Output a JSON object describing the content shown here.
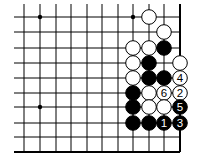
{
  "board": {
    "grid": {
      "xs": [
        24,
        40,
        56,
        71,
        87,
        102,
        118,
        133,
        149,
        164,
        180
      ],
      "ys": [
        17,
        32,
        48,
        63,
        78,
        93,
        107,
        123,
        137,
        152
      ],
      "left_extent": 14,
      "top_extent": 4,
      "right_edge_col": 10,
      "bottom_edge_row": 9
    },
    "line_color": "#000000",
    "stone_radius": 7.3,
    "star_points": [
      [
        1,
        0
      ],
      [
        7,
        0
      ],
      [
        1,
        6
      ]
    ],
    "stones": [
      {
        "col": 8,
        "row": 0,
        "color": "white",
        "label": ""
      },
      {
        "col": 9,
        "row": 1,
        "color": "white",
        "label": ""
      },
      {
        "col": 7,
        "row": 2,
        "color": "white",
        "label": ""
      },
      {
        "col": 8,
        "row": 2,
        "color": "white",
        "label": ""
      },
      {
        "col": 9,
        "row": 2,
        "color": "black",
        "label": ""
      },
      {
        "col": 7,
        "row": 3,
        "color": "white",
        "label": ""
      },
      {
        "col": 8,
        "row": 3,
        "color": "black",
        "label": ""
      },
      {
        "col": 10,
        "row": 3,
        "color": "white",
        "label": ""
      },
      {
        "col": 7,
        "row": 4,
        "color": "white",
        "label": ""
      },
      {
        "col": 8,
        "row": 4,
        "color": "black",
        "label": ""
      },
      {
        "col": 9,
        "row": 4,
        "color": "black",
        "label": ""
      },
      {
        "col": 10,
        "row": 4,
        "color": "white",
        "label": "4"
      },
      {
        "col": 7,
        "row": 5,
        "color": "black",
        "label": ""
      },
      {
        "col": 8,
        "row": 5,
        "color": "white",
        "label": ""
      },
      {
        "col": 9,
        "row": 5,
        "color": "white",
        "label": "6"
      },
      {
        "col": 10,
        "row": 5,
        "color": "white",
        "label": "2"
      },
      {
        "col": 7,
        "row": 6,
        "color": "black",
        "label": ""
      },
      {
        "col": 8,
        "row": 6,
        "color": "white",
        "label": ""
      },
      {
        "col": 9,
        "row": 6,
        "color": "white",
        "label": ""
      },
      {
        "col": 10,
        "row": 6,
        "color": "black",
        "label": "5"
      },
      {
        "col": 7,
        "row": 7,
        "color": "black",
        "label": ""
      },
      {
        "col": 8,
        "row": 7,
        "color": "black",
        "label": ""
      },
      {
        "col": 9,
        "row": 7,
        "color": "black",
        "label": "1"
      },
      {
        "col": 10,
        "row": 7,
        "color": "black",
        "label": "3"
      }
    ]
  }
}
